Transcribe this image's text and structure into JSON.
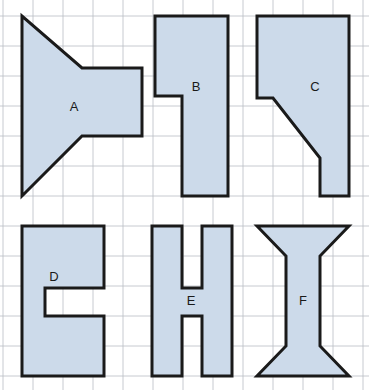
{
  "worksheet": {
    "title": "Polygon shapes on square grid",
    "width": 369,
    "height": 390,
    "background_color": "#ffffff"
  },
  "grid": {
    "name": "square-grid",
    "cell_size": 30,
    "origin_x": 3,
    "origin_y": 16,
    "line_color": "#b9bcc4",
    "line_width": 0.8,
    "columns": 13,
    "rows": 13
  },
  "style": {
    "shape_fill": "#ccdaea",
    "shape_stroke": "#1a1a1a",
    "shape_stroke_width": 3,
    "label_color": "#1a1a1a",
    "label_font_size": 13
  },
  "shapes": [
    {
      "id": "shape-a",
      "label": "A",
      "label_x": 74,
      "label_y": 108,
      "description": "speaker / bowtie shape with two diagonal cuts",
      "points": "22,16 22,196 82,136 142,136 142,68 82,68"
    },
    {
      "id": "shape-b",
      "label": "B",
      "label_x": 196,
      "label_y": 88,
      "description": "inverted L shape with left step notch",
      "points": "155,16 228,16 228,196 182,196 182,96 155,96"
    },
    {
      "id": "shape-c",
      "label": "C",
      "label_x": 315,
      "label_y": 88,
      "description": "rectangle with diagonal lower-left cut",
      "points": "257,16 349,16 349,196 320,196 320,158 273,98 257,98"
    },
    {
      "id": "shape-d",
      "label": "D",
      "label_x": 54,
      "label_y": 278,
      "description": "C shape with rectangular notch on right",
      "points": "22,226 104,226 104,288 45,288 45,316 104,316 104,376 22,376"
    },
    {
      "id": "shape-e",
      "label": "E",
      "label_x": 191,
      "label_y": 302,
      "description": "H shape",
      "points": "152,226 182,226 182,288 202,288 202,226 232,226 232,376 202,376 202,316 182,316 182,376 152,376"
    },
    {
      "id": "shape-f",
      "label": "F",
      "label_x": 303,
      "label_y": 302,
      "description": "I-beam / spool shape with flared ends",
      "points": "257,226 349,226 320,256 320,346 349,376 257,376 286,346 286,256"
    }
  ]
}
